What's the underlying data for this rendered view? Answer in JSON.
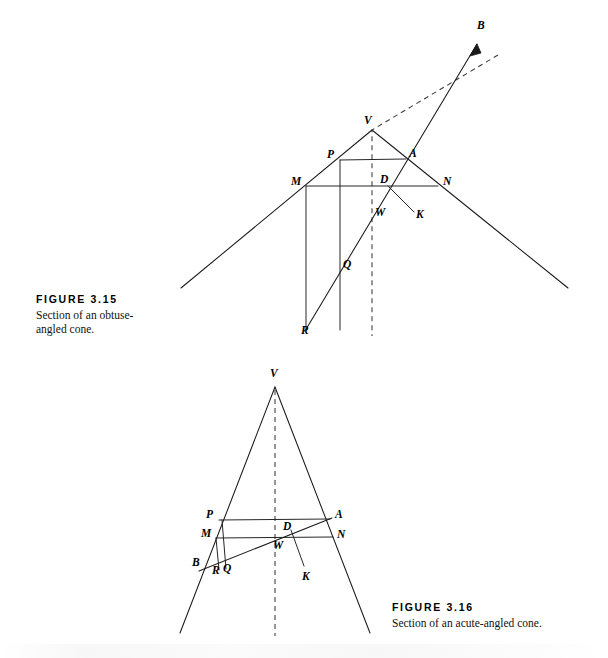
{
  "page": {
    "background": "#ffffff",
    "ink": "#1a1a1a"
  },
  "figures": [
    {
      "id": "figure-3-15",
      "caption_title": "FIGURE  3.15",
      "caption_text": "Section of an obtuse-angled cone.",
      "caption_pos": {
        "x": 36,
        "y": 293
      },
      "point_labels": [
        {
          "name": "B",
          "text": "B",
          "x": 477,
          "y": 20
        },
        {
          "name": "V",
          "text": "V",
          "x": 364,
          "y": 115
        },
        {
          "name": "P",
          "text": "P",
          "x": 327,
          "y": 149
        },
        {
          "name": "A",
          "text": "A",
          "x": 409,
          "y": 148
        },
        {
          "name": "M",
          "text": "M",
          "x": 291,
          "y": 176
        },
        {
          "name": "D",
          "text": "D",
          "x": 380,
          "y": 174
        },
        {
          "name": "N",
          "text": "N",
          "x": 443,
          "y": 176
        },
        {
          "name": "W",
          "text": "W",
          "x": 375,
          "y": 207
        },
        {
          "name": "K",
          "text": "K",
          "x": 416,
          "y": 209
        },
        {
          "name": "Q",
          "text": "Q",
          "x": 343,
          "y": 259
        },
        {
          "name": "R",
          "text": "R",
          "x": 301,
          "y": 325
        }
      ],
      "geometry": {
        "type": "obtuse-angled-cone-section",
        "vertex": {
          "x": 372,
          "y": 130
        },
        "cone_left_end": {
          "x": 181,
          "y": 288
        },
        "cone_right_end": {
          "x": 568,
          "y": 288
        },
        "axis_dashed_end": {
          "x": 372,
          "y": 336
        },
        "axis_dashed_top": {
          "x": 498,
          "y": 55
        },
        "chord_PA": {
          "x1": 340,
          "y1": 160,
          "x2": 406,
          "y2": 159
        },
        "chord_MN": {
          "x1": 306,
          "y1": 186,
          "x2": 438,
          "y2": 186
        },
        "vertical_M_R": {
          "x1": 306,
          "y1": 186,
          "x2": 306,
          "y2": 330
        },
        "vertical_P_Q": {
          "x1": 340,
          "y1": 160,
          "x2": 340,
          "y2": 330
        },
        "line_R_B": {
          "x1": 305,
          "y1": 330,
          "x2": 479,
          "y2": 40
        },
        "line_D_K": {
          "x1": 388,
          "y1": 186,
          "x2": 414,
          "y2": 213
        },
        "point_D": {
          "x": 388,
          "y": 186
        },
        "point_W": {
          "x": 371,
          "y": 212
        },
        "point_Q": {
          "x": 340,
          "y": 268
        }
      }
    },
    {
      "id": "figure-3-16",
      "caption_title": "FIGURE  3.16",
      "caption_text": "Section of an acute-angled cone.",
      "caption_pos": {
        "x": 392,
        "y": 601
      },
      "point_labels": [
        {
          "name": "V",
          "text": "V",
          "x": 270,
          "y": 368
        },
        {
          "name": "P",
          "text": "P",
          "x": 206,
          "y": 509
        },
        {
          "name": "A",
          "text": "A",
          "x": 335,
          "y": 509
        },
        {
          "name": "M",
          "text": "M",
          "x": 201,
          "y": 528
        },
        {
          "name": "D",
          "text": "D",
          "x": 283,
          "y": 521
        },
        {
          "name": "N",
          "text": "N",
          "x": 337,
          "y": 529
        },
        {
          "name": "W",
          "text": "W",
          "x": 273,
          "y": 540
        },
        {
          "name": "B",
          "text": "B",
          "x": 192,
          "y": 557
        },
        {
          "name": "R",
          "text": "R",
          "x": 212,
          "y": 565
        },
        {
          "name": "Q",
          "text": "Q",
          "x": 223,
          "y": 563
        },
        {
          "name": "K",
          "text": "K",
          "x": 302,
          "y": 571
        }
      ],
      "geometry": {
        "type": "acute-angled-cone-section",
        "vertex": {
          "x": 275,
          "y": 387
        },
        "cone_left_end": {
          "x": 180,
          "y": 633
        },
        "cone_right_end": {
          "x": 370,
          "y": 633
        },
        "axis_dashed_end": {
          "x": 275,
          "y": 636
        },
        "chord_PA": {
          "x1": 219,
          "y1": 520,
          "x2": 330,
          "y2": 519
        },
        "chord_MN": {
          "x1": 216,
          "y1": 538,
          "x2": 333,
          "y2": 537
        },
        "vertical_M_R": {
          "x1": 216,
          "y1": 538,
          "x2": 219,
          "y2": 570
        },
        "vertical_P_Q": {
          "x1": 222,
          "y1": 520,
          "x2": 226,
          "y2": 569
        },
        "line_B_A": {
          "x1": 199,
          "y1": 571,
          "x2": 332,
          "y2": 518
        },
        "line_D_K": {
          "x1": 291,
          "y1": 530,
          "x2": 304,
          "y2": 566
        },
        "point_D": {
          "x": 291,
          "y": 530
        },
        "point_W": {
          "x": 275,
          "y": 540
        },
        "point_B": {
          "x": 199,
          "y": 571
        }
      }
    }
  ]
}
